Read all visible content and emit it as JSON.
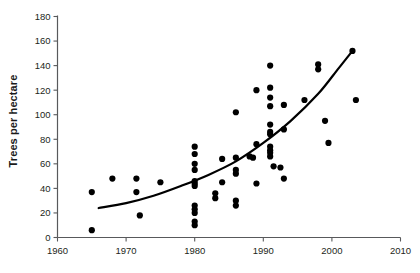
{
  "chart_data": {
    "type": "scatter",
    "title": "",
    "xlabel": "",
    "ylabel": "Trees per hectare",
    "xlim": [
      1960,
      2010
    ],
    "ylim": [
      0,
      180
    ],
    "xticks": [
      1960,
      1970,
      1980,
      1990,
      2000,
      2010
    ],
    "yticks": [
      0,
      20,
      40,
      60,
      80,
      100,
      120,
      140,
      160,
      180
    ],
    "xtick_labels": [
      "1960",
      "1970",
      "1980",
      "1990",
      "2000",
      "2010"
    ],
    "ytick_labels": [
      "0",
      "20",
      "40",
      "60",
      "80",
      "100",
      "120",
      "140",
      "160",
      "180"
    ],
    "grid": false,
    "legend": "none",
    "marker": "filled-circle",
    "marker_color": "#000000",
    "points": [
      {
        "x": 1965,
        "y": 37
      },
      {
        "x": 1965,
        "y": 6
      },
      {
        "x": 1968,
        "y": 48
      },
      {
        "x": 1971.5,
        "y": 48
      },
      {
        "x": 1971.5,
        "y": 37
      },
      {
        "x": 1972,
        "y": 18
      },
      {
        "x": 1975,
        "y": 45
      },
      {
        "x": 1980,
        "y": 74
      },
      {
        "x": 1980,
        "y": 68
      },
      {
        "x": 1980,
        "y": 60
      },
      {
        "x": 1980,
        "y": 55
      },
      {
        "x": 1980,
        "y": 46
      },
      {
        "x": 1980,
        "y": 44
      },
      {
        "x": 1980,
        "y": 42
      },
      {
        "x": 1980,
        "y": 26
      },
      {
        "x": 1980,
        "y": 23
      },
      {
        "x": 1980,
        "y": 20
      },
      {
        "x": 1980,
        "y": 13
      },
      {
        "x": 1980,
        "y": 10
      },
      {
        "x": 1983,
        "y": 36
      },
      {
        "x": 1983,
        "y": 32
      },
      {
        "x": 1984,
        "y": 64
      },
      {
        "x": 1984,
        "y": 45
      },
      {
        "x": 1986,
        "y": 102
      },
      {
        "x": 1986,
        "y": 65
      },
      {
        "x": 1986,
        "y": 55
      },
      {
        "x": 1986,
        "y": 52
      },
      {
        "x": 1986,
        "y": 30
      },
      {
        "x": 1986,
        "y": 26
      },
      {
        "x": 1988,
        "y": 66
      },
      {
        "x": 1988.5,
        "y": 65
      },
      {
        "x": 1989,
        "y": 120
      },
      {
        "x": 1989,
        "y": 76
      },
      {
        "x": 1989,
        "y": 44
      },
      {
        "x": 1991,
        "y": 140
      },
      {
        "x": 1991,
        "y": 122
      },
      {
        "x": 1991,
        "y": 114
      },
      {
        "x": 1991,
        "y": 107
      },
      {
        "x": 1991,
        "y": 92
      },
      {
        "x": 1991,
        "y": 86
      },
      {
        "x": 1991,
        "y": 84
      },
      {
        "x": 1991,
        "y": 74
      },
      {
        "x": 1991,
        "y": 71
      },
      {
        "x": 1991,
        "y": 69
      },
      {
        "x": 1991,
        "y": 66
      },
      {
        "x": 1991.5,
        "y": 58
      },
      {
        "x": 1992.5,
        "y": 57
      },
      {
        "x": 1993,
        "y": 108
      },
      {
        "x": 1993,
        "y": 88
      },
      {
        "x": 1993,
        "y": 48
      },
      {
        "x": 1996,
        "y": 112
      },
      {
        "x": 1998,
        "y": 141
      },
      {
        "x": 1998,
        "y": 137
      },
      {
        "x": 1999,
        "y": 95
      },
      {
        "x": 1999.5,
        "y": 77
      },
      {
        "x": 2003,
        "y": 152
      },
      {
        "x": 2003.5,
        "y": 112
      }
    ],
    "trend_line": {
      "style": "solid",
      "color": "#000000",
      "description": "fitted increasing curve",
      "points": [
        {
          "x": 1966,
          "y": 24
        },
        {
          "x": 1970,
          "y": 28
        },
        {
          "x": 1974,
          "y": 34
        },
        {
          "x": 1978,
          "y": 42
        },
        {
          "x": 1982,
          "y": 51
        },
        {
          "x": 1986,
          "y": 62
        },
        {
          "x": 1990,
          "y": 77
        },
        {
          "x": 1994,
          "y": 95
        },
        {
          "x": 1998,
          "y": 117
        },
        {
          "x": 2001,
          "y": 138
        },
        {
          "x": 2003,
          "y": 152
        }
      ]
    }
  }
}
